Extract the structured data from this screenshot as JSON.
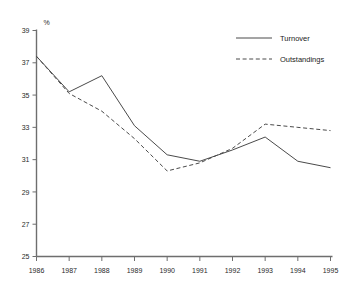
{
  "chart_data": {
    "type": "line",
    "title": "",
    "xlabel": "",
    "ylabel": "%",
    "categories": [
      "1986",
      "1987",
      "1988",
      "1989",
      "1990",
      "1991",
      "1992",
      "1993",
      "1994",
      "1995"
    ],
    "x": [
      1986,
      1987,
      1988,
      1989,
      1990,
      1991,
      1992,
      1993,
      1994,
      1995
    ],
    "series": [
      {
        "name": "Turnover",
        "style": "solid",
        "color": "#4a4a4a",
        "values": [
          37.4,
          35.2,
          36.2,
          33.1,
          31.3,
          30.9,
          31.6,
          32.4,
          30.9,
          30.5
        ]
      },
      {
        "name": "Outstandings",
        "style": "dashed",
        "color": "#4a4a4a",
        "values": [
          37.4,
          35.1,
          34.0,
          32.3,
          30.3,
          30.8,
          31.7,
          33.2,
          33.0,
          32.8
        ]
      }
    ],
    "ylim": [
      25,
      39
    ],
    "yticks": [
      25,
      27,
      29,
      31,
      33,
      35,
      37,
      39
    ],
    "ytick_labels": [
      "25",
      "27",
      "29",
      "31",
      "33",
      "35",
      "37",
      "39"
    ],
    "xtick_labels": [
      "1986",
      "1987",
      "1988",
      "1989",
      "1990",
      "1991",
      "1992",
      "1993",
      "1994",
      "1995"
    ],
    "grid": false,
    "legend_position": "top-right",
    "legend": [
      "Turnover",
      "Outstandings"
    ]
  },
  "axis": {
    "unit_label": "%"
  },
  "legend": {
    "entries": [
      {
        "label": "Turnover"
      },
      {
        "label": "Outstandings"
      }
    ]
  }
}
